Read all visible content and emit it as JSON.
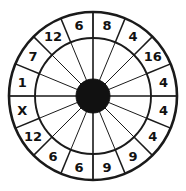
{
  "figure": {
    "background_color": "#ffffff",
    "line_color": "#1a1a1a",
    "hub_color": "#111111",
    "label_color": "#111111"
  },
  "chart_data": {
    "type": "pie",
    "subtitle": "",
    "xlabel": "",
    "ylabel": "",
    "legend_position": "none",
    "grid": false,
    "sector_count": 16,
    "equal_sectors": true,
    "sector_angle_degrees": 22.5,
    "start_angle_degrees": -90,
    "direction": "clockwise",
    "categories": [
      "s1",
      "s2",
      "s3",
      "s4",
      "s5",
      "s6",
      "s7",
      "s8",
      "s9",
      "s10",
      "s11",
      "s12",
      "s13",
      "s14",
      "s15",
      "s16"
    ],
    "values": [
      1,
      1,
      1,
      1,
      1,
      1,
      1,
      1,
      1,
      1,
      1,
      1,
      1,
      1,
      1,
      1
    ],
    "labels": [
      "8",
      "4",
      "16",
      "4",
      "4",
      "4",
      "9",
      "9",
      "6",
      "6",
      "12",
      "X",
      "1",
      "7",
      "12",
      "6"
    ],
    "labels_clockwise_from_top": [
      "8",
      "4",
      "16",
      "4",
      "4",
      "4",
      "9",
      "9",
      "6",
      "6",
      "12",
      "X",
      "1",
      "7",
      "12",
      "6"
    ],
    "annotations": [
      {
        "label": "8",
        "position": "top, right of vertical axis"
      },
      {
        "label": "4",
        "position": "upper right"
      },
      {
        "label": "16",
        "position": "upper right"
      },
      {
        "label": "4",
        "position": "right, above horizontal axis"
      },
      {
        "label": "4",
        "position": "right, below horizontal axis"
      },
      {
        "label": "4",
        "position": "lower right"
      },
      {
        "label": "9",
        "position": "lower right"
      },
      {
        "label": "9",
        "position": "bottom, right of vertical axis"
      },
      {
        "label": "6",
        "position": "bottom, left of vertical axis"
      },
      {
        "label": "6",
        "position": "lower left"
      },
      {
        "label": "12",
        "position": "lower left"
      },
      {
        "label": "X",
        "position": "left, below horizontal axis"
      },
      {
        "label": "1",
        "position": "left, above horizontal axis"
      },
      {
        "label": "7",
        "position": "upper left"
      },
      {
        "label": "12",
        "position": "upper left"
      },
      {
        "label": "6",
        "position": "top, left of vertical axis"
      }
    ],
    "geometry": {
      "center_x": 93,
      "center_y": 96,
      "outer_radius": 84,
      "label_ring_inner_radius": 58,
      "hub_radius": 17,
      "rings": [
        "outer circle",
        "label ring inner circle",
        "hub circle"
      ],
      "spoke_count": 16
    }
  }
}
